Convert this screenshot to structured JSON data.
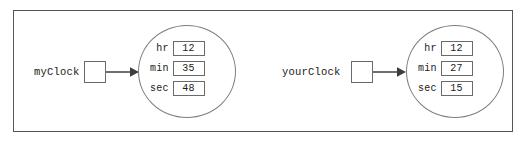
{
  "diagram": {
    "background_color": "#ffffff",
    "frame_border_color": "#555555",
    "line_color": "#4a4a4a",
    "shape_border_color": "#7d7d7d",
    "text_color": "#1a1a1a",
    "variables": [
      {
        "name": "myClock",
        "label": "myClock",
        "pointer_box": "",
        "arrow": "points-to-arrow",
        "object": {
          "shape": "ellipse",
          "fields": [
            {
              "name": "hr",
              "value": "12"
            },
            {
              "name": "min",
              "value": "35"
            },
            {
              "name": "sec",
              "value": "48"
            }
          ]
        }
      },
      {
        "name": "yourClock",
        "label": "yourClock",
        "pointer_box": "",
        "arrow": "points-to-arrow",
        "object": {
          "shape": "ellipse",
          "fields": [
            {
              "name": "hr",
              "value": "12"
            },
            {
              "name": "min",
              "value": "27"
            },
            {
              "name": "sec",
              "value": "15"
            }
          ]
        }
      }
    ]
  }
}
